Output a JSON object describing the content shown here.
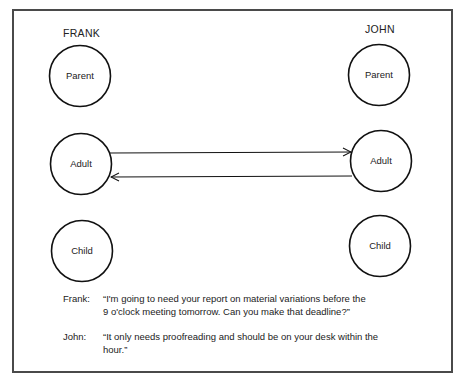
{
  "diagram": {
    "persons": [
      {
        "name": "FRANK",
        "states": [
          {
            "label": "Parent",
            "cx": 80,
            "cy": 76
          },
          {
            "label": "Adult",
            "cx": 81,
            "cy": 164
          },
          {
            "label": "Child",
            "cx": 82,
            "cy": 251
          }
        ]
      },
      {
        "name": "JOHN",
        "states": [
          {
            "label": "Parent",
            "cx": 379,
            "cy": 75
          },
          {
            "label": "Adult",
            "cx": 381,
            "cy": 161
          },
          {
            "label": "Child",
            "cx": 380,
            "cy": 246
          }
        ]
      }
    ],
    "transactions": [
      {
        "from": "FRANK.Adult",
        "to": "JOHN.Adult",
        "direction": "right"
      },
      {
        "from": "JOHN.Adult",
        "to": "FRANK.Adult",
        "direction": "left"
      }
    ],
    "dialogue": [
      {
        "speaker": "Frank:",
        "text": "“I'm going to need your report on material variations before the\n9 o'clock meeting tomorrow.  Can you make that deadline?”"
      },
      {
        "speaker": "John:",
        "text": "“It only needs proofreading and should be on your desk within the\nhour.”"
      }
    ],
    "colors": {
      "stroke": "#111111",
      "frame": "#4a4a4a",
      "text": "#222222"
    }
  }
}
